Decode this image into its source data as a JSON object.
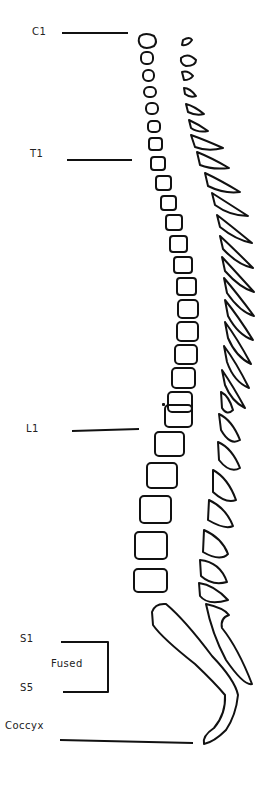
{
  "labels": {
    "c1": "C1",
    "t1": "T1",
    "l1": "L1",
    "s1": "S1",
    "s5": "S5",
    "fused": "Fused",
    "coccyx": "Coccyx"
  },
  "colors": {
    "stroke": "#111111",
    "background": "#ffffff"
  }
}
